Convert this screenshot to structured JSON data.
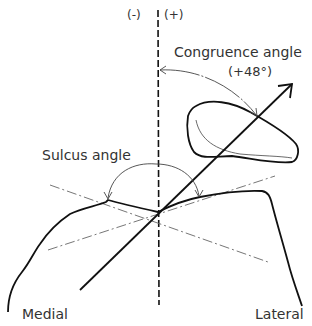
{
  "diagram": {
    "labels": {
      "minus": "(-)",
      "plus": "(+)",
      "congruence_angle": "Congruence angle",
      "congruence_value": "(+48°)",
      "sulcus_angle": "Sulcus angle",
      "medial": "Medial",
      "lateral": "Lateral"
    },
    "colors": {
      "line": "#111111",
      "thin_line": "#555555",
      "text": "#333333"
    }
  }
}
